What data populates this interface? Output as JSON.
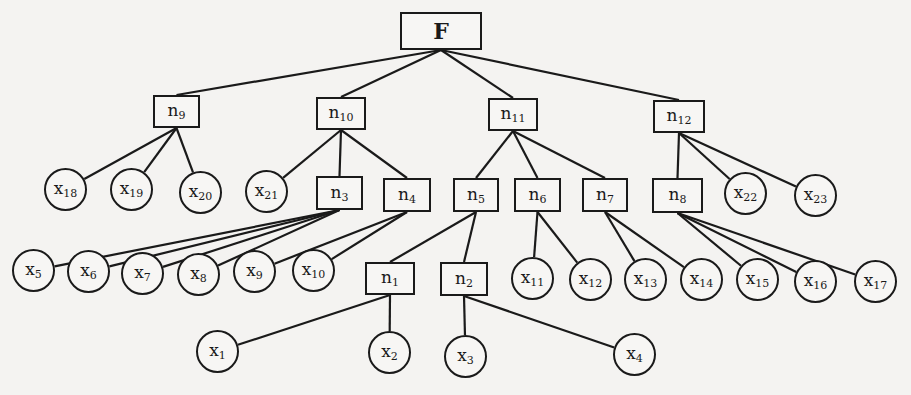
{
  "diagram": {
    "type": "tree",
    "root": "F",
    "colors": {
      "line": "#1a1a1a",
      "background": "#f4f3f1",
      "node_fill": "#f7f6f4"
    },
    "nodes": [
      {
        "id": "F",
        "base": "F",
        "sub": "",
        "shape": "rect",
        "x": 400,
        "y": 12,
        "w": 82,
        "h": 38
      },
      {
        "id": "n9",
        "base": "n",
        "sub": "9",
        "shape": "rect",
        "x": 153,
        "y": 95,
        "w": 47,
        "h": 33
      },
      {
        "id": "n10",
        "base": "n",
        "sub": "10",
        "shape": "rect",
        "x": 316,
        "y": 97,
        "w": 50,
        "h": 33
      },
      {
        "id": "n11",
        "base": "n",
        "sub": "11",
        "shape": "rect",
        "x": 488,
        "y": 98,
        "w": 50,
        "h": 33
      },
      {
        "id": "n12",
        "base": "n",
        "sub": "12",
        "shape": "rect",
        "x": 653,
        "y": 100,
        "w": 52,
        "h": 33
      },
      {
        "id": "x18",
        "base": "x",
        "sub": "18",
        "shape": "circle",
        "x": 44,
        "y": 168,
        "w": 43,
        "h": 43
      },
      {
        "id": "x19",
        "base": "x",
        "sub": "19",
        "shape": "circle",
        "x": 110,
        "y": 168,
        "w": 43,
        "h": 43
      },
      {
        "id": "x20",
        "base": "x",
        "sub": "20",
        "shape": "circle",
        "x": 179,
        "y": 171,
        "w": 43,
        "h": 43
      },
      {
        "id": "x21",
        "base": "x",
        "sub": "21",
        "shape": "circle",
        "x": 245,
        "y": 170,
        "w": 43,
        "h": 43
      },
      {
        "id": "n3",
        "base": "n",
        "sub": "3",
        "shape": "rect",
        "x": 316,
        "y": 176,
        "w": 47,
        "h": 34
      },
      {
        "id": "n4",
        "base": "n",
        "sub": "4",
        "shape": "rect",
        "x": 383,
        "y": 178,
        "w": 48,
        "h": 34
      },
      {
        "id": "n5",
        "base": "n",
        "sub": "5",
        "shape": "rect",
        "x": 453,
        "y": 178,
        "w": 46,
        "h": 34
      },
      {
        "id": "n6",
        "base": "n",
        "sub": "6",
        "shape": "rect",
        "x": 514,
        "y": 178,
        "w": 47,
        "h": 34
      },
      {
        "id": "n7",
        "base": "n",
        "sub": "7",
        "shape": "rect",
        "x": 582,
        "y": 178,
        "w": 46,
        "h": 34
      },
      {
        "id": "n8",
        "base": "n",
        "sub": "8",
        "shape": "rect",
        "x": 652,
        "y": 178,
        "w": 51,
        "h": 35
      },
      {
        "id": "x22",
        "base": "x",
        "sub": "22",
        "shape": "circle",
        "x": 724,
        "y": 172,
        "w": 43,
        "h": 43
      },
      {
        "id": "x23",
        "base": "x",
        "sub": "23",
        "shape": "circle",
        "x": 794,
        "y": 174,
        "w": 43,
        "h": 43
      },
      {
        "id": "x5",
        "base": "x",
        "sub": "5",
        "shape": "circle",
        "x": 12,
        "y": 249,
        "w": 43,
        "h": 43
      },
      {
        "id": "x6",
        "base": "x",
        "sub": "6",
        "shape": "circle",
        "x": 67,
        "y": 250,
        "w": 43,
        "h": 43
      },
      {
        "id": "x7",
        "base": "x",
        "sub": "7",
        "shape": "circle",
        "x": 121,
        "y": 252,
        "w": 43,
        "h": 43
      },
      {
        "id": "x8",
        "base": "x",
        "sub": "8",
        "shape": "circle",
        "x": 177,
        "y": 253,
        "w": 43,
        "h": 43
      },
      {
        "id": "x9",
        "base": "x",
        "sub": "9",
        "shape": "circle",
        "x": 233,
        "y": 250,
        "w": 43,
        "h": 43
      },
      {
        "id": "x10",
        "base": "x",
        "sub": "10",
        "shape": "circle",
        "x": 292,
        "y": 249,
        "w": 43,
        "h": 43
      },
      {
        "id": "n1",
        "base": "n",
        "sub": "1",
        "shape": "rect",
        "x": 365,
        "y": 262,
        "w": 50,
        "h": 33
      },
      {
        "id": "n2",
        "base": "n",
        "sub": "2",
        "shape": "rect",
        "x": 440,
        "y": 262,
        "w": 48,
        "h": 34
      },
      {
        "id": "x11",
        "base": "x",
        "sub": "11",
        "shape": "circle",
        "x": 511,
        "y": 257,
        "w": 43,
        "h": 43
      },
      {
        "id": "x12",
        "base": "x",
        "sub": "12",
        "shape": "circle",
        "x": 569,
        "y": 258,
        "w": 43,
        "h": 43
      },
      {
        "id": "x13",
        "base": "x",
        "sub": "13",
        "shape": "circle",
        "x": 624,
        "y": 258,
        "w": 43,
        "h": 43
      },
      {
        "id": "x14",
        "base": "x",
        "sub": "14",
        "shape": "circle",
        "x": 680,
        "y": 258,
        "w": 43,
        "h": 43
      },
      {
        "id": "x15",
        "base": "x",
        "sub": "15",
        "shape": "circle",
        "x": 736,
        "y": 258,
        "w": 43,
        "h": 43
      },
      {
        "id": "x16",
        "base": "x",
        "sub": "16",
        "shape": "circle",
        "x": 794,
        "y": 260,
        "w": 43,
        "h": 43
      },
      {
        "id": "x17",
        "base": "x",
        "sub": "17",
        "shape": "circle",
        "x": 854,
        "y": 260,
        "w": 43,
        "h": 43
      },
      {
        "id": "x1",
        "base": "x",
        "sub": "1",
        "shape": "circle",
        "x": 196,
        "y": 330,
        "w": 43,
        "h": 43
      },
      {
        "id": "x2",
        "base": "x",
        "sub": "2",
        "shape": "circle",
        "x": 368,
        "y": 331,
        "w": 43,
        "h": 43
      },
      {
        "id": "x3",
        "base": "x",
        "sub": "3",
        "shape": "circle",
        "x": 444,
        "y": 335,
        "w": 43,
        "h": 43
      },
      {
        "id": "x4",
        "base": "x",
        "sub": "4",
        "shape": "circle",
        "x": 613,
        "y": 333,
        "w": 43,
        "h": 43
      }
    ],
    "edges": [
      [
        "F",
        "n9"
      ],
      [
        "F",
        "n10"
      ],
      [
        "F",
        "n11"
      ],
      [
        "F",
        "n12"
      ],
      [
        "n9",
        "x18"
      ],
      [
        "n9",
        "x19"
      ],
      [
        "n9",
        "x20"
      ],
      [
        "n10",
        "x21"
      ],
      [
        "n10",
        "n3"
      ],
      [
        "n10",
        "n4"
      ],
      [
        "n11",
        "n5"
      ],
      [
        "n11",
        "n6"
      ],
      [
        "n11",
        "n7"
      ],
      [
        "n12",
        "n8"
      ],
      [
        "n12",
        "x22"
      ],
      [
        "n12",
        "x23"
      ],
      [
        "n3",
        "x5"
      ],
      [
        "n3",
        "x6"
      ],
      [
        "n3",
        "x7"
      ],
      [
        "n3",
        "x8"
      ],
      [
        "n4",
        "x9"
      ],
      [
        "n4",
        "x10"
      ],
      [
        "n5",
        "n1"
      ],
      [
        "n5",
        "n2"
      ],
      [
        "n6",
        "x11"
      ],
      [
        "n6",
        "x12"
      ],
      [
        "n7",
        "x13"
      ],
      [
        "n7",
        "x14"
      ],
      [
        "n8",
        "x15"
      ],
      [
        "n8",
        "x16"
      ],
      [
        "n8",
        "x17"
      ],
      [
        "n1",
        "x1"
      ],
      [
        "n1",
        "x2"
      ],
      [
        "n2",
        "x3"
      ],
      [
        "n2",
        "x4"
      ]
    ]
  }
}
